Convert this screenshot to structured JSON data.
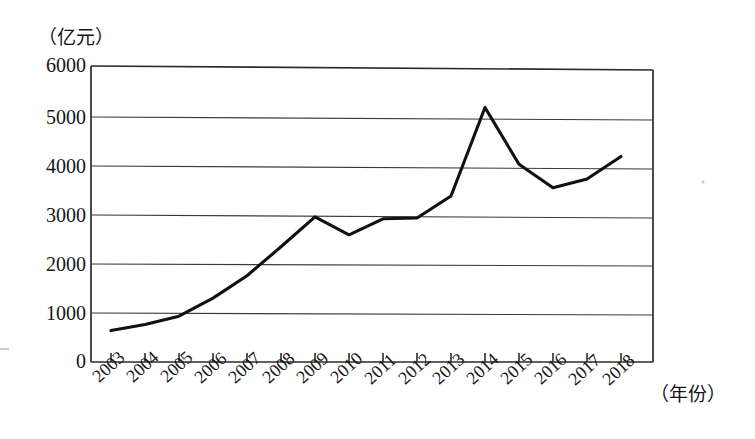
{
  "chart_data": {
    "type": "line",
    "title": "",
    "subtitle": "",
    "xlabel": "（年份）",
    "ylabel": "（亿元）",
    "unit_note": "（亿元）",
    "categories": [
      "2003",
      "2004",
      "2005",
      "2006",
      "2007",
      "2008",
      "2009",
      "2010",
      "2011",
      "2012",
      "2013",
      "2014",
      "2015",
      "2016",
      "2017",
      "2018"
    ],
    "values": [
      630,
      760,
      930,
      1300,
      1760,
      2350,
      2960,
      2600,
      2930,
      2950,
      3400,
      5200,
      4050,
      3580,
      3760,
      4220
    ],
    "series": [
      {
        "name": "金额",
        "values": [
          630,
          760,
          930,
          1300,
          1760,
          2350,
          2960,
          2600,
          2930,
          2950,
          3400,
          5200,
          4050,
          3580,
          3760,
          4220
        ]
      }
    ],
    "ylim": [
      0,
      6000
    ],
    "ytick_labels": [
      "0",
      "1000",
      "2000",
      "3000",
      "4000",
      "5000",
      "6000"
    ],
    "ytick_values": [
      0,
      1000,
      2000,
      3000,
      4000,
      5000,
      6000
    ],
    "xtick_labels": [
      "2003",
      "2004",
      "2005",
      "2006",
      "2007",
      "2008",
      "2009",
      "2010",
      "2011",
      "2012",
      "2013",
      "2014",
      "2015",
      "2016",
      "2017",
      "2018"
    ],
    "grid": "horizontal",
    "legend": "none",
    "line_color": "#111111",
    "grid_color": "#3a3a3a",
    "background_color": "#ffffff"
  },
  "axes": {
    "y_unit_label": "（亿元）",
    "x_unit_label": "（年份）",
    "y_ticks": [
      "6000",
      "5000",
      "4000",
      "3000",
      "2000",
      "1000",
      "0"
    ],
    "x_ticks": [
      "2003",
      "2004",
      "2005",
      "2006",
      "2007",
      "2008",
      "2009",
      "2010",
      "2011",
      "2012",
      "2013",
      "2014",
      "2015",
      "2016",
      "2017",
      "2018"
    ]
  }
}
